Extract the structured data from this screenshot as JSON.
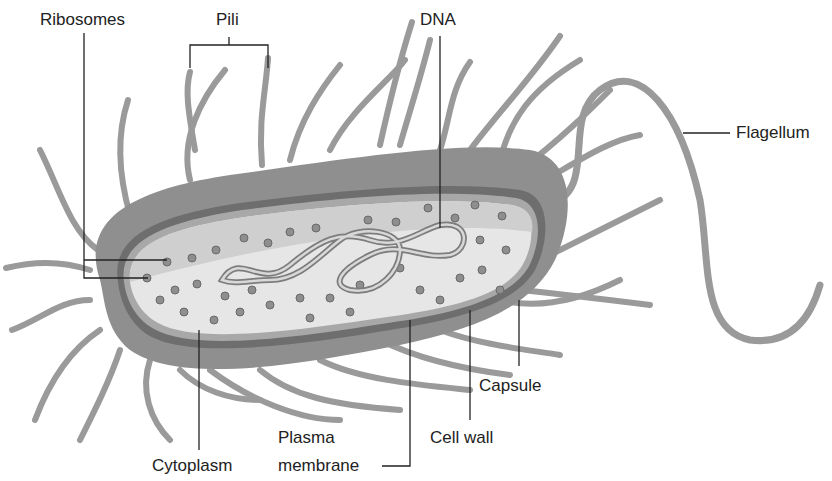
{
  "figure": {
    "labels": {
      "ribosomes": "Ribosomes",
      "pili": "Pili",
      "dna": "DNA",
      "flagellum": "Flagellum",
      "capsule": "Capsule",
      "cell_wall": "Cell wall",
      "plasma_membrane_line1": "Plasma",
      "plasma_membrane_line2": "membrane",
      "cytoplasm": "Cytoplasm"
    },
    "colors": {
      "capsule": "#8f8f8f",
      "cell_wall": "#6e6e6e",
      "membrane": "#a8a8a8",
      "cytoplasm": "#e6e6e6",
      "cytoplasm_shadow": "#cfcfcf",
      "ribosome": "#8e8e8e",
      "pili": "#9a9a9a",
      "leader_lines": "#222222"
    }
  }
}
